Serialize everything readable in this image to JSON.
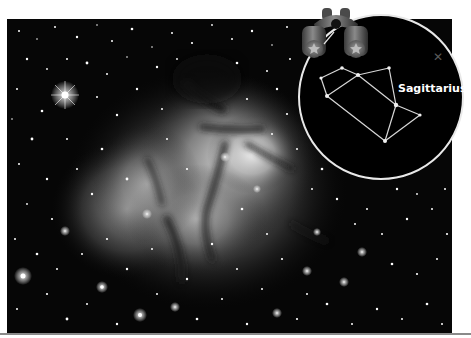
{
  "image": {
    "subject": "Trifid Nebula star field",
    "tone": "grayscale"
  },
  "overlay": {
    "constellation_name": "Sagittarius",
    "close_icon": "close-x-icon",
    "binoculars_icon": "binoculars-icon",
    "colors": {
      "circle_fill": "#000000",
      "circle_border": "#e8e8e8",
      "line": "#d8d8d8",
      "label": "#ffffff",
      "close": "#5a5a5a"
    },
    "stars": [
      {
        "x": 321,
        "y": 78
      },
      {
        "x": 342,
        "y": 68
      },
      {
        "x": 358,
        "y": 75
      },
      {
        "x": 389,
        "y": 68
      },
      {
        "x": 327,
        "y": 96
      },
      {
        "x": 396,
        "y": 105
      },
      {
        "x": 420,
        "y": 115
      },
      {
        "x": 385,
        "y": 141
      }
    ]
  }
}
